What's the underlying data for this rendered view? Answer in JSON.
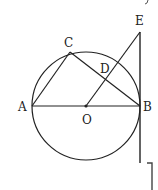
{
  "diagram": {
    "type": "geometry",
    "circle": {
      "center": "O",
      "cx": 86,
      "cy": 106,
      "r": 54
    },
    "points": {
      "A": {
        "label": "A",
        "x": 32,
        "y": 106
      },
      "B": {
        "label": "B",
        "x": 140,
        "y": 106
      },
      "C": {
        "label": "C",
        "x": 70,
        "y": 52
      },
      "D": {
        "label": "D",
        "x": 106,
        "y": 78
      },
      "E": {
        "label": "E",
        "x": 140,
        "y": 32
      },
      "O": {
        "label": "O",
        "x": 86,
        "y": 106
      }
    },
    "segments": [
      "AB",
      "AC",
      "CB",
      "OE",
      "EB-tangent"
    ],
    "colors": {
      "stroke": "#222222",
      "background": "#ffffff"
    }
  }
}
